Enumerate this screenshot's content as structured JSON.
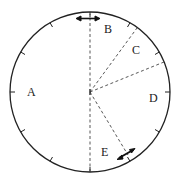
{
  "diagram": {
    "type": "circle-sectors",
    "center": [
      90,
      92
    ],
    "radius": 80,
    "stroke_color": "#222222",
    "sectors": [
      {
        "label": "A",
        "pos": [
          27,
          96
        ]
      },
      {
        "label": "B",
        "pos": [
          105,
          33
        ]
      },
      {
        "label": "C",
        "pos": [
          134,
          53
        ]
      },
      {
        "label": "D",
        "pos": [
          152,
          102
        ]
      },
      {
        "label": "E",
        "pos": [
          103,
          154
        ]
      }
    ],
    "dashed_radii_angles_deg": [
      -90,
      -53,
      -22,
      60,
      90
    ],
    "markers": [
      {
        "name": "top-double-arrow",
        "angle_deg": -90
      },
      {
        "name": "bottom-right-double-arrow",
        "angle_deg": 60
      }
    ]
  }
}
